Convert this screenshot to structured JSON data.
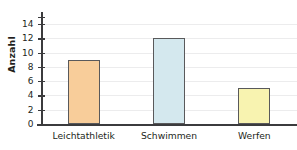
{
  "chart_data": {
    "type": "bar",
    "title": "",
    "xlabel": "",
    "ylabel": "Anzahl",
    "categories": [
      "Leichtathletik",
      "Schwimmen",
      "Werfen"
    ],
    "values": [
      9,
      12,
      5
    ],
    "bar_colors": [
      "#f8cd9a",
      "#d4e8ee",
      "#f8f3b0"
    ],
    "bar_border_color": "#59595b",
    "ylim": [
      0,
      15
    ],
    "ytick_labels": [
      "0",
      "2",
      "4",
      "6",
      "8",
      "10",
      "12",
      "14"
    ],
    "ytick_values": [
      0,
      2,
      4,
      6,
      8,
      10,
      12,
      14
    ],
    "grid": true,
    "grid_color": "#ececed",
    "legend": null,
    "axis_color": "#3b3b3d",
    "background": "#ffffff"
  }
}
